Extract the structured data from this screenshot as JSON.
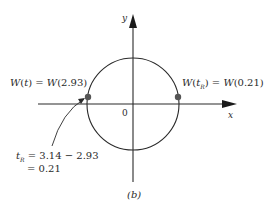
{
  "figure": {
    "caption": "(b)",
    "axes": {
      "x_label": "x",
      "y_label": "y",
      "origin_label": "0"
    },
    "points": [
      {
        "id": "left-point",
        "label": "W(t) = W(2.93)"
      },
      {
        "id": "right-point",
        "label": "W(t_R) = W(0.21)",
        "label_display": "W(tR) = W(0.21)"
      }
    ],
    "annotation": {
      "line1": "tR = 3.14 − 2.93",
      "line2": "= 0.21"
    },
    "colors": {
      "stroke": "#2a2a2a",
      "dot": "#555555",
      "background": "#ffffff"
    }
  }
}
